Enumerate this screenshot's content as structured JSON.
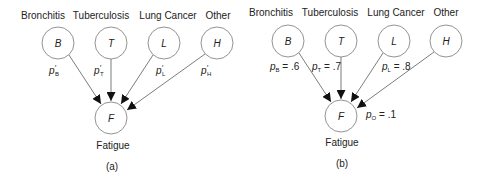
{
  "panels": [
    {
      "caption": "(a)",
      "causes": [
        {
          "name": "Bronchitis",
          "var": "B",
          "prob": "p",
          "sub": "B",
          "prime": "′",
          "val": ""
        },
        {
          "name": "Tuberculosis",
          "var": "T",
          "prob": "p",
          "sub": "T",
          "prime": "′",
          "val": ""
        },
        {
          "name": "Lung Cancer",
          "var": "L",
          "prob": "p",
          "sub": "L",
          "prime": "′",
          "val": ""
        },
        {
          "name": "Other",
          "var": "H",
          "prob": "p",
          "sub": "H",
          "prime": "′",
          "val": ""
        }
      ],
      "effect": {
        "name": "Fatigue",
        "var": "F"
      }
    },
    {
      "caption": "(b)",
      "causes": [
        {
          "name": "Bronchitis",
          "var": "B",
          "prob": "p",
          "sub": "B",
          "val": " = .6"
        },
        {
          "name": "Tuberculosis",
          "var": "T",
          "prob": "p",
          "sub": "T",
          "val": " = .7"
        },
        {
          "name": "Lung Cancer",
          "var": "L",
          "prob": "p",
          "sub": "L",
          "val": " = .8"
        },
        {
          "name": "Other",
          "var": "H"
        }
      ],
      "effect": {
        "name": "Fatigue",
        "var": "F",
        "prob": "p",
        "sub": "O",
        "val": " = .1"
      }
    }
  ]
}
